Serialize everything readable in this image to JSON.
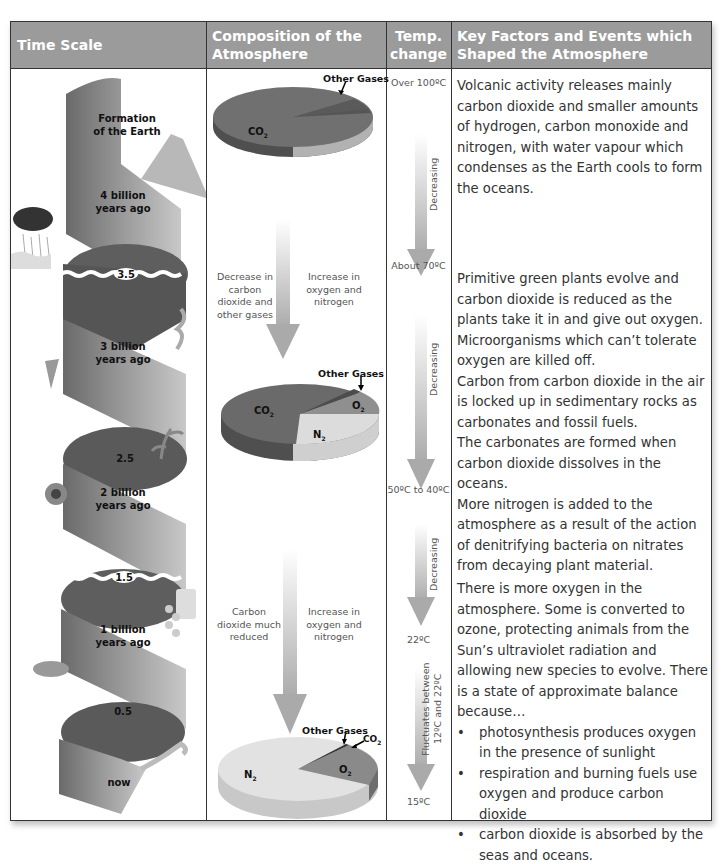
{
  "headers": {
    "time_scale": "Time Scale",
    "composition": "Composition of the Atmosphere",
    "temp": "Temp. change",
    "key_factors": "Key Factors and Events which Shaped the Atmosphere"
  },
  "colors": {
    "header_bg": "#9b9b9b",
    "border": "#333333",
    "co2_slice": "#6e6e6e",
    "o2_slice": "#8f8f8f",
    "n2_slice": "#dcdcdc",
    "other_slice": "#5a5a5a",
    "arrow": "#b5b5b5",
    "spiral": "#8a8a8a"
  },
  "time_scale": {
    "labels": [
      {
        "id": "formation",
        "line1": "Formation",
        "line2": "of the Earth"
      },
      {
        "id": "4bya",
        "line1": "4 billion",
        "line2": "years ago"
      },
      {
        "id": "3.5",
        "line1": "3.5"
      },
      {
        "id": "3bya",
        "line1": "3 billion",
        "line2": "years ago"
      },
      {
        "id": "2.5",
        "line1": "2.5"
      },
      {
        "id": "2bya",
        "line1": "2 billion",
        "line2": "years ago"
      },
      {
        "id": "1.5",
        "line1": "1.5"
      },
      {
        "id": "1bya",
        "line1": "1 billion",
        "line2": "years ago"
      },
      {
        "id": "0.5",
        "line1": "0.5"
      },
      {
        "id": "now",
        "line1": "now"
      }
    ]
  },
  "composition": {
    "pie1": {
      "co2": "CO",
      "co2_sub": "2",
      "other": "Other Gases"
    },
    "arrow1": {
      "left": "Decrease in carbon dioxide and other gases",
      "right": "Increase in oxygen and nitrogen"
    },
    "pie2": {
      "co2": "CO",
      "co2_sub": "2",
      "o2": "O",
      "o2_sub": "2",
      "n2": "N",
      "n2_sub": "2",
      "other": "Other Gases"
    },
    "arrow2": {
      "left": "Carbon dioxide much reduced",
      "right": "Increase in oxygen and nitrogen"
    },
    "pie3": {
      "co2": "CO",
      "co2_sub": "2",
      "o2": "O",
      "o2_sub": "2",
      "n2": "N",
      "n2_sub": "2",
      "other": "Other Gases"
    }
  },
  "temperature": {
    "t1": "Over 100ºC",
    "d1": "Decreasing",
    "t2": "About 70ºC",
    "d2": "Decreasing",
    "t3": "50ºC to 40ºC",
    "d3": "Decreasing",
    "t4": "22ºC",
    "d4": "Fluctuates between 12ºC and 22ºC",
    "t5": "15ºC"
  },
  "key_factors": {
    "p1": "Volcanic activity releases mainly carbon dioxide and smaller amounts of hydrogen, carbon monoxide and nitrogen, with water vapour which condenses as the Earth cools to form the oceans.",
    "p2a": "Primitive green plants evolve and carbon dioxide is reduced as the plants take it in and give out oxygen.",
    "p2b": "Microorganisms which can’t tolerate oxygen are killed off.",
    "p2c": "Carbon from carbon dioxide in the air is locked up in sedimentary rocks as carbonates and fossil fuels.",
    "p2d": "The carbonates are formed when carbon dioxide dissolves in the oceans.",
    "p2e": "More nitrogen is added to the atmosphere as a result of the action of denitrifying bacteria on nitrates from decaying plant material.",
    "p3": "There is more oxygen in the atmosphere. Some is converted to ozone, protecting animals from the Sun’s ultraviolet radiation and allowing new species to evolve. There is a state of approximate balance because…",
    "bullets": [
      "photosynthesis produces oxygen in the presence of sunlight",
      "respiration and burning fuels use oxygen and produce carbon dioxide",
      "carbon dioxide is absorbed by the seas and oceans."
    ],
    "bullet_char": "•"
  }
}
